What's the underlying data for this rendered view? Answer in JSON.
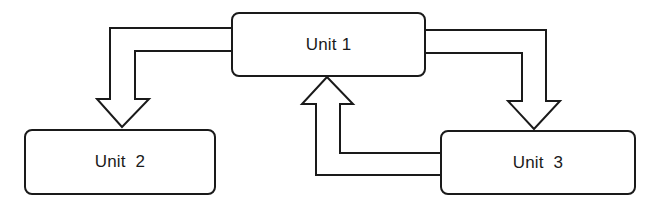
{
  "diagram": {
    "units": [
      {
        "id": "unit1",
        "label": "Unit 1"
      },
      {
        "id": "unit2",
        "label": "Unit  2"
      },
      {
        "id": "unit3",
        "label": "Unit  3"
      }
    ],
    "connections": [
      {
        "from": "Unit 1",
        "to": "Unit 2",
        "style": "hollow block arrow"
      },
      {
        "from": "Unit 1",
        "to": "Unit 3",
        "style": "hollow block arrow"
      },
      {
        "from": "Unit 3",
        "to": "Unit 1",
        "style": "hollow block arrow"
      }
    ],
    "colors": {
      "stroke": "#1a1a1a",
      "fill": "#ffffff",
      "background": "#ffffff"
    }
  }
}
